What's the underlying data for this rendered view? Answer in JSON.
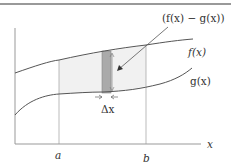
{
  "diagram": {
    "labels": {
      "difference": "(f(x) − g(x))",
      "f": "f(x)",
      "g": "g(x)",
      "delta_x": "Δx",
      "x_axis": "x",
      "a": "a",
      "b": "b"
    },
    "colors": {
      "curve": "#555555",
      "axis": "#777777",
      "region_fill": "#f0f0f0",
      "strip_fill": "#a8a8a8",
      "border": "#666666"
    }
  }
}
